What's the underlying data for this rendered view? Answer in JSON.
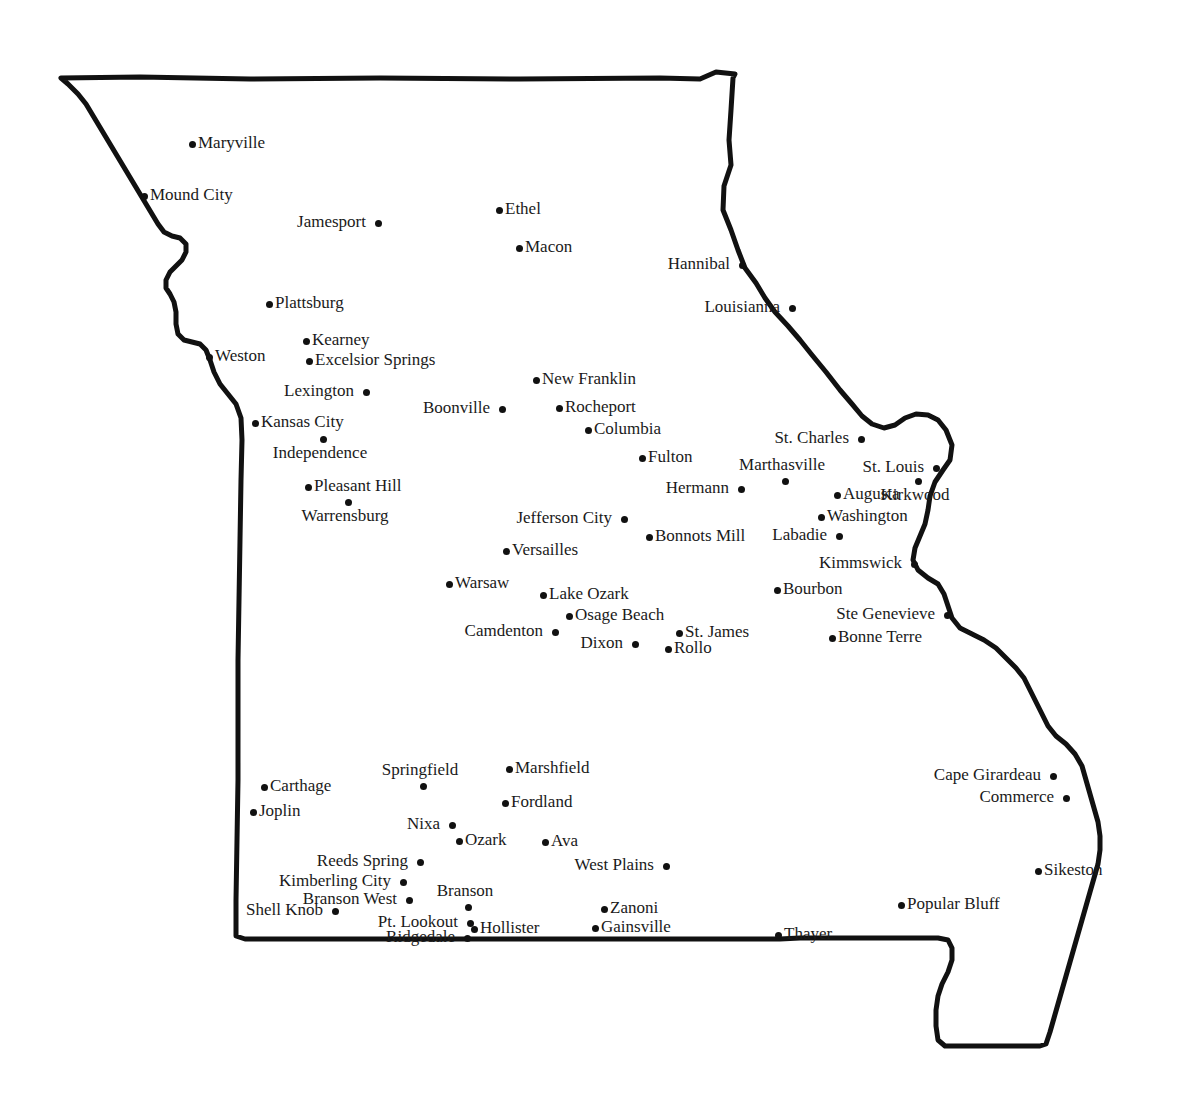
{
  "map": {
    "title": "Missouri",
    "subject": "Missouri state outline with labeled cities",
    "colors": {
      "background": "#ffffff",
      "border_stroke": "#111111",
      "marker": "#111111",
      "label_text": "#1a1a1a"
    },
    "border": {
      "stroke_width": 5,
      "style": "hand-drawn rough outline",
      "path": "M 61,78 L 140,77 L 250,79 L 380,78 L 520,79 L 660,78 L 700,79 L 716,72 L 735,74 L 733,78 L 731,110 L 729,140 L 731,165 L 724,186 L 723,210 L 731,230 L 738,250 L 745,268 L 756,283 L 765,298 L 775,312 L 788,326 L 800,340 L 812,355 L 826,372 L 840,390 L 852,404 L 862,416 L 872,424 L 884,428 L 895,425 L 905,418 L 916,414 L 928,415 L 938,420 L 946,430 L 952,445 L 950,460 L 943,470 L 935,482 L 930,496 L 928,510 L 925,524 L 920,536 L 915,548 L 913,560 L 918,570 L 928,578 L 938,584 L 944,594 L 948,606 L 952,618 L 960,628 L 972,634 L 984,640 L 996,648 L 1006,658 L 1016,668 L 1024,678 L 1030,690 L 1036,702 L 1042,714 L 1048,726 L 1056,736 L 1066,744 L 1075,754 L 1082,766 L 1086,780 L 1090,794 L 1094,808 L 1098,822 L 1100,836 L 1100,850 L 1098,864 L 1094,878 L 1090,892 L 1086,906 L 1082,920 L 1078,934 L 1074,948 L 1070,962 L 1066,976 L 1062,990 L 1058,1004 L 1054,1018 L 1050,1032 L 1046,1044 L 1040,1046 L 1020,1046 L 1000,1046 L 980,1046 L 960,1046 L 945,1046 L 938,1040 L 936,1026 L 936,1010 L 938,996 L 942,984 L 948,972 L 952,960 L 952,948 L 948,940 L 938,938 L 920,938 L 900,938 L 880,938 L 860,938 L 840,938 L 820,938 L 800,938 L 780,939 L 700,939 L 600,939 L 500,939 L 400,939 L 300,939 L 245,939 L 236,936 L 236,900 L 237,840 L 238,780 L 238,720 L 238,660 L 239,600 L 240,540 L 241,480 L 242,440 L 241,418 L 236,404 L 228,394 L 220,384 L 214,372 L 210,360 L 206,350 L 200,344 L 192,342 L 184,340 L 178,334 L 176,324 L 176,312 L 174,302 L 170,294 L 166,288 L 166,280 L 170,272 L 176,266 L 182,260 L 186,252 L 186,244 L 180,238 L 172,236 L 164,232 L 158,224 L 152,214 L 146,204 L 140,194 L 134,184 L 128,174 L 122,164 L 116,154 L 110,144 L 104,134 L 98,124 L 92,114 L 86,104 L 78,94 L 68,84 Z"
    }
  },
  "cities": [
    {
      "name": "Maryville",
      "x": 189,
      "y": 141,
      "label_pos": "right"
    },
    {
      "name": "Mound  City",
      "x": 141,
      "y": 193,
      "label_pos": "right"
    },
    {
      "name": "Jamesport",
      "x": 375,
      "y": 220,
      "label_pos": "left"
    },
    {
      "name": "Ethel",
      "x": 496,
      "y": 207,
      "label_pos": "right"
    },
    {
      "name": "Macon",
      "x": 516,
      "y": 245,
      "label_pos": "right"
    },
    {
      "name": "Hannibal",
      "x": 739,
      "y": 262,
      "label_pos": "left"
    },
    {
      "name": "Louisianna",
      "x": 789,
      "y": 305,
      "label_pos": "left"
    },
    {
      "name": "Plattsburg",
      "x": 266,
      "y": 301,
      "label_pos": "right"
    },
    {
      "name": "Kearney",
      "x": 303,
      "y": 338,
      "label_pos": "right"
    },
    {
      "name": "Excelsior Springs",
      "x": 306,
      "y": 358,
      "label_pos": "right"
    },
    {
      "name": "Weston",
      "x": 206,
      "y": 354,
      "label_pos": "right"
    },
    {
      "name": "Lexington",
      "x": 363,
      "y": 389,
      "label_pos": "left"
    },
    {
      "name": "Kansas City",
      "x": 252,
      "y": 420,
      "label_pos": "right"
    },
    {
      "name": "Independence",
      "x": 320,
      "y": 436,
      "label_pos": "below"
    },
    {
      "name": "Pleasant Hill",
      "x": 305,
      "y": 484,
      "label_pos": "right"
    },
    {
      "name": "Warrensburg",
      "x": 345,
      "y": 499,
      "label_pos": "below"
    },
    {
      "name": "Boonville",
      "x": 499,
      "y": 406,
      "label_pos": "left"
    },
    {
      "name": "New Franklin",
      "x": 533,
      "y": 377,
      "label_pos": "right"
    },
    {
      "name": "Rocheport",
      "x": 556,
      "y": 405,
      "label_pos": "right"
    },
    {
      "name": "Columbia",
      "x": 585,
      "y": 427,
      "label_pos": "right"
    },
    {
      "name": "Fulton",
      "x": 639,
      "y": 455,
      "label_pos": "right"
    },
    {
      "name": "Hermann",
      "x": 738,
      "y": 486,
      "label_pos": "left"
    },
    {
      "name": "Jefferson City",
      "x": 621,
      "y": 516,
      "label_pos": "left"
    },
    {
      "name": "Bonnots Mill",
      "x": 646,
      "y": 534,
      "label_pos": "right"
    },
    {
      "name": "Versailles",
      "x": 503,
      "y": 548,
      "label_pos": "right"
    },
    {
      "name": "Warsaw",
      "x": 446,
      "y": 581,
      "label_pos": "right"
    },
    {
      "name": "Lake Ozark",
      "x": 540,
      "y": 592,
      "label_pos": "right"
    },
    {
      "name": "Osage Beach",
      "x": 566,
      "y": 613,
      "label_pos": "right"
    },
    {
      "name": "Camdenton",
      "x": 552,
      "y": 629,
      "label_pos": "left"
    },
    {
      "name": "Dixon",
      "x": 632,
      "y": 641,
      "label_pos": "left"
    },
    {
      "name": "St. James",
      "x": 676,
      "y": 630,
      "label_pos": "right"
    },
    {
      "name": "Rollo",
      "x": 665,
      "y": 646,
      "label_pos": "right"
    },
    {
      "name": "St. Charles",
      "x": 858,
      "y": 436,
      "label_pos": "left"
    },
    {
      "name": "Marthasville",
      "x": 782,
      "y": 478,
      "label_pos": "above"
    },
    {
      "name": "St. Louis",
      "x": 933,
      "y": 465,
      "label_pos": "left"
    },
    {
      "name": "Kirkwood",
      "x": 915,
      "y": 478,
      "label_pos": "below"
    },
    {
      "name": "Augusta",
      "x": 834,
      "y": 492,
      "label_pos": "right"
    },
    {
      "name": "Washington",
      "x": 818,
      "y": 514,
      "label_pos": "right"
    },
    {
      "name": "Labadie",
      "x": 836,
      "y": 533,
      "label_pos": "left"
    },
    {
      "name": "Kimmswick",
      "x": 911,
      "y": 561,
      "label_pos": "left"
    },
    {
      "name": "Bourbon",
      "x": 774,
      "y": 587,
      "label_pos": "right"
    },
    {
      "name": "Ste Genevieve",
      "x": 944,
      "y": 612,
      "label_pos": "left"
    },
    {
      "name": "Bonne Terre",
      "x": 829,
      "y": 635,
      "label_pos": "right"
    },
    {
      "name": "Springfield",
      "x": 420,
      "y": 783,
      "label_pos": "above"
    },
    {
      "name": "Marshfield",
      "x": 506,
      "y": 766,
      "label_pos": "right"
    },
    {
      "name": "Carthage",
      "x": 261,
      "y": 784,
      "label_pos": "right"
    },
    {
      "name": "Joplin",
      "x": 250,
      "y": 809,
      "label_pos": "right"
    },
    {
      "name": "Fordland",
      "x": 502,
      "y": 800,
      "label_pos": "right"
    },
    {
      "name": "Nixa",
      "x": 449,
      "y": 822,
      "label_pos": "left"
    },
    {
      "name": "Ozark",
      "x": 456,
      "y": 838,
      "label_pos": "right"
    },
    {
      "name": "Ava",
      "x": 542,
      "y": 839,
      "label_pos": "right"
    },
    {
      "name": "West Plains",
      "x": 663,
      "y": 863,
      "label_pos": "left"
    },
    {
      "name": "Reeds Spring",
      "x": 417,
      "y": 859,
      "label_pos": "left"
    },
    {
      "name": "Kimberling City",
      "x": 400,
      "y": 879,
      "label_pos": "left"
    },
    {
      "name": "Branson West",
      "x": 406,
      "y": 897,
      "label_pos": "left"
    },
    {
      "name": "Shell Knob",
      "x": 332,
      "y": 908,
      "label_pos": "left"
    },
    {
      "name": "Branson",
      "x": 465,
      "y": 904,
      "label_pos": "above"
    },
    {
      "name": "Pt. Lookout",
      "x": 467,
      "y": 920,
      "label_pos": "left"
    },
    {
      "name": "Hollister",
      "x": 471,
      "y": 926,
      "label_pos": "right"
    },
    {
      "name": "Ridgedale",
      "x": 464,
      "y": 935,
      "label_pos": "left"
    },
    {
      "name": "Zanoni",
      "x": 601,
      "y": 906,
      "label_pos": "right"
    },
    {
      "name": "Gainsville",
      "x": 592,
      "y": 925,
      "label_pos": "right"
    },
    {
      "name": "Thayer",
      "x": 775,
      "y": 932,
      "label_pos": "right"
    },
    {
      "name": "Cape Girardeau",
      "x": 1050,
      "y": 773,
      "label_pos": "left"
    },
    {
      "name": "Commerce",
      "x": 1063,
      "y": 795,
      "label_pos": "left"
    },
    {
      "name": "Sikeston",
      "x": 1035,
      "y": 868,
      "label_pos": "right"
    },
    {
      "name": "Popular Bluff",
      "x": 898,
      "y": 902,
      "label_pos": "right"
    }
  ]
}
